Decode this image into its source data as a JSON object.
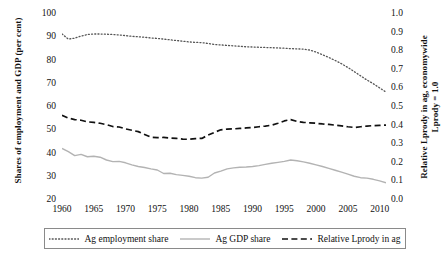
{
  "chart_data": {
    "type": "line",
    "title": "",
    "xlabel": "",
    "ylabel": "Shares of employment and GDP (per cent)",
    "y2label": "Relative Lprody in ag, economywide Lprody = 1.0",
    "grid": false,
    "legend_position": "bottom",
    "xlim": [
      1960,
      2011
    ],
    "ylim": [
      20,
      100
    ],
    "y2lim": [
      0.0,
      1.0
    ],
    "x_ticks": [
      "1960",
      "1965",
      "1970",
      "1975",
      "1980",
      "1985",
      "1990",
      "1995",
      "2000",
      "2005",
      "2010"
    ],
    "y_left_ticks": [
      "100",
      "90",
      "80",
      "70",
      "60",
      "50",
      "40",
      "30",
      "20"
    ],
    "y_right_ticks": [
      "1.0",
      "0.9",
      "0.8",
      "0.7",
      "0.6",
      "0.5",
      "0.4",
      "0.3",
      "0.2",
      "0.1",
      "0.0"
    ],
    "x": [
      1960,
      1961,
      1962,
      1963,
      1964,
      1965,
      1966,
      1967,
      1968,
      1969,
      1970,
      1971,
      1972,
      1973,
      1974,
      1975,
      1976,
      1977,
      1978,
      1979,
      1980,
      1981,
      1982,
      1983,
      1984,
      1985,
      1986,
      1987,
      1988,
      1989,
      1990,
      1991,
      1992,
      1993,
      1994,
      1995,
      1996,
      1997,
      1998,
      1999,
      2000,
      2001,
      2002,
      2003,
      2004,
      2005,
      2006,
      2007,
      2008,
      2009,
      2010,
      2011
    ],
    "series": [
      {
        "name": "Ag employment share",
        "axis": "left",
        "style": "dotted",
        "color": "#555555",
        "values": [
          91.4,
          89.2,
          89.6,
          90.5,
          91.2,
          91.4,
          91.4,
          91.3,
          91.2,
          91.0,
          90.7,
          90.4,
          90.2,
          90.0,
          89.7,
          89.5,
          89.2,
          88.9,
          88.6,
          88.3,
          88.0,
          87.8,
          87.7,
          87.3,
          86.9,
          86.7,
          86.5,
          86.3,
          86.1,
          85.9,
          85.8,
          85.7,
          85.6,
          85.5,
          85.4,
          85.3,
          85.1,
          85.0,
          84.9,
          84.5,
          83.6,
          82.5,
          81.3,
          80.0,
          78.6,
          77.0,
          75.2,
          73.4,
          71.6,
          70.0,
          68.2,
          66.4
        ]
      },
      {
        "name": "Ag GDP share",
        "axis": "left",
        "style": "solid",
        "color": "#b3b3b3",
        "values": [
          42.2,
          40.8,
          39.1,
          39.6,
          38.6,
          38.8,
          38.4,
          37.2,
          36.5,
          36.6,
          36.0,
          35.1,
          34.4,
          34.0,
          33.4,
          32.9,
          31.4,
          31.5,
          30.9,
          30.6,
          30.2,
          29.6,
          29.4,
          29.8,
          31.6,
          32.4,
          33.4,
          33.8,
          34.1,
          34.2,
          34.4,
          34.8,
          35.3,
          35.8,
          36.2,
          36.6,
          37.2,
          36.9,
          36.4,
          35.8,
          35.1,
          34.4,
          33.6,
          32.8,
          32.0,
          31.1,
          30.2,
          29.6,
          29.4,
          28.9,
          28.2,
          27.4
        ]
      },
      {
        "name": "Relative Lprody in ag",
        "axis": "left",
        "style": "dashed",
        "color": "#111111",
        "values": [
          56.4,
          55.2,
          54.6,
          54.3,
          53.6,
          53.4,
          53.0,
          52.4,
          51.6,
          51.4,
          50.6,
          50.0,
          49.4,
          48.2,
          47.0,
          46.8,
          46.9,
          46.7,
          46.5,
          46.2,
          46.1,
          46.4,
          46.5,
          47.9,
          49.1,
          50.2,
          50.5,
          50.6,
          50.8,
          51.0,
          51.2,
          51.5,
          51.8,
          52.2,
          53.0,
          54.0,
          54.6,
          53.8,
          53.4,
          53.2,
          53.0,
          52.7,
          52.5,
          52.2,
          51.9,
          51.5,
          51.2,
          51.5,
          51.8,
          52.0,
          52.1,
          52.2
        ],
        "right_axis_values": [
          0.455,
          0.44,
          0.433,
          0.429,
          0.42,
          0.418,
          0.413,
          0.405,
          0.395,
          0.393,
          0.383,
          0.375,
          0.368,
          0.353,
          0.338,
          0.335,
          0.336,
          0.334,
          0.331,
          0.328,
          0.326,
          0.33,
          0.331,
          0.349,
          0.364,
          0.378,
          0.381,
          0.383,
          0.385,
          0.388,
          0.39,
          0.394,
          0.398,
          0.403,
          0.413,
          0.425,
          0.433,
          0.423,
          0.418,
          0.415,
          0.413,
          0.409,
          0.406,
          0.403,
          0.399,
          0.394,
          0.39,
          0.394,
          0.398,
          0.4,
          0.401,
          0.403
        ]
      }
    ]
  },
  "legend": {
    "items": [
      {
        "label": "Ag employment share",
        "style": "dotted",
        "color": "#555555"
      },
      {
        "label": "Ag GDP share",
        "style": "solid",
        "color": "#b3b3b3"
      },
      {
        "label": "Relative Lprody in ag",
        "style": "dashed",
        "color": "#111111"
      }
    ]
  },
  "axes": {
    "left_title": "Shares of employment and GDP (per cent)",
    "right_title": "Relative Lprody in ag, economywide Lprody = 1.0"
  }
}
